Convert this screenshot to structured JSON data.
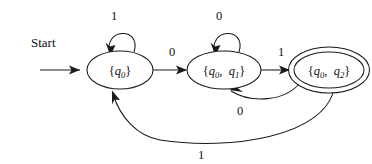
{
  "figure": {
    "kind": "finite-automaton-state-diagram",
    "start_label": "Start",
    "states": [
      {
        "id": "s0",
        "label": "{q0}",
        "label_parts": {
          "open": "{",
          "var": "q",
          "sub": "0",
          "close": "}"
        },
        "accepting": false,
        "cx": 120,
        "cy": 70,
        "rx": 33,
        "ry": 19
      },
      {
        "id": "s1",
        "label": "{q0, q1}",
        "label_parts": {
          "open": "{",
          "var1": "q",
          "sub1": "0",
          "comma": ",",
          "var2": "q",
          "sub2": "1",
          "close": "}"
        },
        "accepting": false,
        "cx": 224,
        "cy": 70,
        "rx": 37,
        "ry": 19
      },
      {
        "id": "s2",
        "label": "{q0, q2}",
        "label_parts": {
          "open": "{",
          "var1": "q",
          "sub1": "0",
          "comma": ",",
          "var2": "q",
          "sub2": "2",
          "close": "}"
        },
        "accepting": true,
        "cx": 329,
        "cy": 70,
        "rx": 37,
        "ry": 19
      }
    ],
    "transitions": [
      {
        "id": "t-self-0",
        "from": "s0",
        "to": "s0",
        "symbol": "1",
        "kind": "self-loop-top",
        "label_x": 114,
        "label_y": 20
      },
      {
        "id": "t-0-1",
        "from": "s0",
        "to": "s1",
        "symbol": "0",
        "kind": "straight",
        "label_x": 172,
        "label_y": 56
      },
      {
        "id": "t-self-1",
        "from": "s1",
        "to": "s1",
        "symbol": "0",
        "kind": "self-loop-top",
        "label_x": 219,
        "label_y": 20
      },
      {
        "id": "t-1-2",
        "from": "s1",
        "to": "s2",
        "symbol": "1",
        "kind": "straight",
        "label_x": 281,
        "label_y": 56
      },
      {
        "id": "t-2-1",
        "from": "s2",
        "to": "s1",
        "symbol": "0",
        "kind": "curve-below-short",
        "label_x": 240,
        "label_y": 111
      },
      {
        "id": "t-2-0",
        "from": "s2",
        "to": "s0",
        "symbol": "1",
        "kind": "curve-below-long",
        "label_x": 201,
        "label_y": 155
      }
    ],
    "icons": {
      "start_arrow": "arrow-right-icon",
      "accepting_marker": "double-ellipse-icon"
    },
    "colors": {
      "stroke": "#1a1a1a",
      "text": "#111111",
      "background": "#ffffff"
    }
  }
}
